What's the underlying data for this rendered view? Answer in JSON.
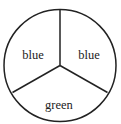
{
  "diagram": {
    "type": "spinner",
    "sections": [
      {
        "label": "blue",
        "position": "upper-left"
      },
      {
        "label": "blue",
        "position": "upper-right"
      },
      {
        "label": "green",
        "position": "bottom"
      }
    ],
    "colors": {
      "stroke": "#222222",
      "background": "#ffffff"
    }
  }
}
